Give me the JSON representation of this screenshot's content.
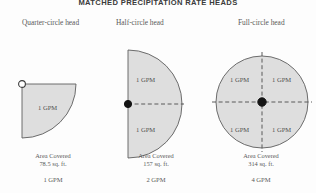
{
  "figure": {
    "title": "MATCHED PRECIPITATION RATE HEADS",
    "background_color": "#fdfdfd",
    "shape_fill_color": "#dedede",
    "shape_stroke_color": "#5d5d5d",
    "text_color": "#5a5a5a"
  },
  "columns": [
    {
      "id": "quarter-circle",
      "heading": "Quarter-circle head",
      "arc_degrees": 90,
      "sector_labels": [
        "1 GPM"
      ],
      "pivot_style": "open-circle",
      "area_label": "Area Covered",
      "area_value": "78.5 sq. ft.",
      "total_flow": "1 GPM"
    },
    {
      "id": "half-circle",
      "heading": "Half-circle head",
      "arc_degrees": 180,
      "sector_labels": [
        "1 GPM",
        "1 GPM"
      ],
      "pivot_style": "solid-dot",
      "area_label": "Area Covered",
      "area_value": "157 sq. ft.",
      "total_flow": "2 GPM"
    },
    {
      "id": "full-circle",
      "heading": "Full-circle head",
      "arc_degrees": 360,
      "sector_labels": [
        "1 GPM",
        "1 GPM",
        "1 GPM",
        "1 GPM"
      ],
      "pivot_style": "solid-dot",
      "area_label": "Area Covered",
      "area_value": "314 sq. ft.",
      "total_flow": "4 GPM"
    }
  ]
}
